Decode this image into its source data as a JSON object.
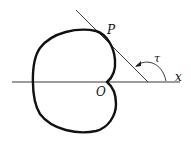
{
  "figure": {
    "labels": {
      "point_P": "P",
      "origin": "O",
      "angle": "τ",
      "axis": "x"
    },
    "colors": {
      "stroke": "#111111",
      "background": "#ffffff"
    }
  }
}
